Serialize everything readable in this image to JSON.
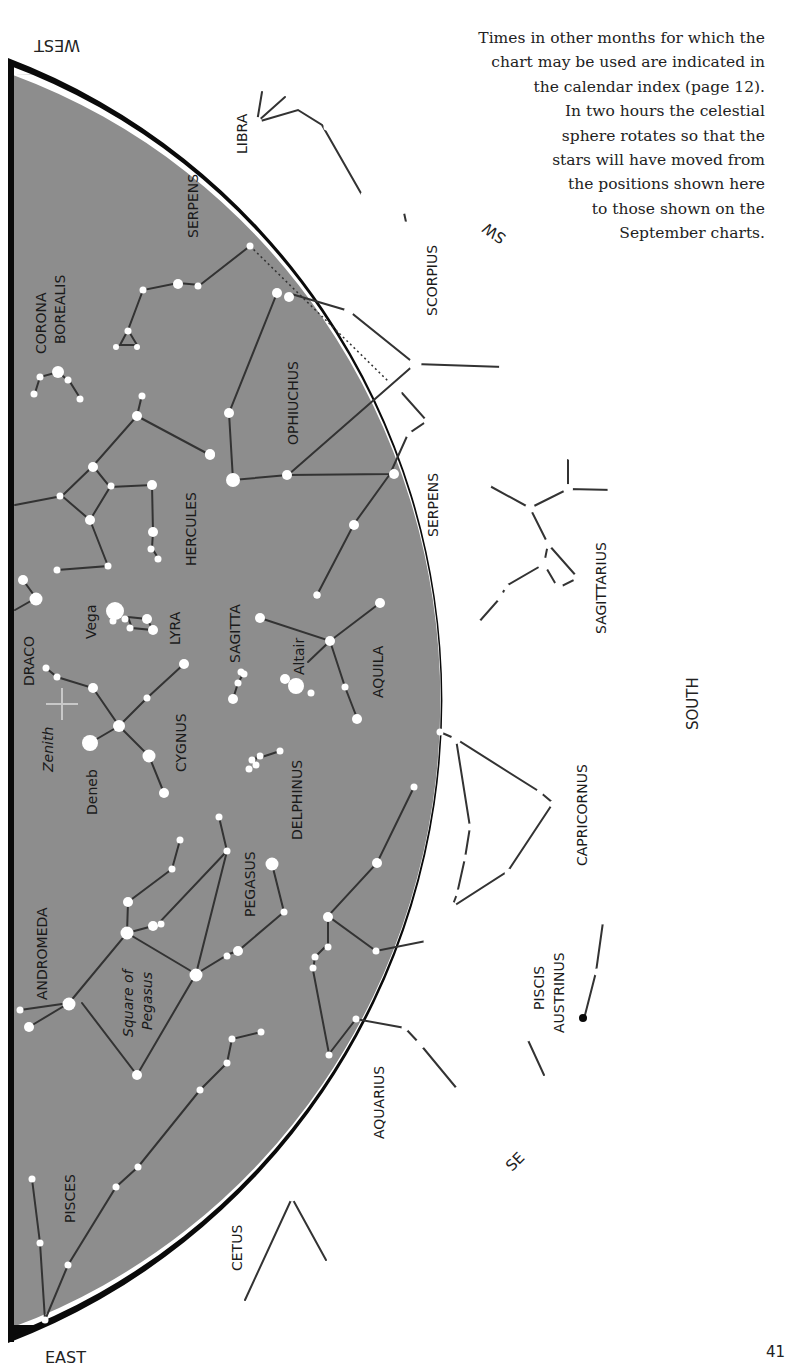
{
  "caption": {
    "lines": [
      "Times in other months for which the",
      "chart may be used are indicated in",
      "the calendar index (page 12).",
      "In two hours the celestial",
      "sphere rotates so that the",
      "stars will have moved from",
      "the positions shown here",
      "to those shown on the",
      "September charts."
    ]
  },
  "page_number": "41",
  "cardinals": {
    "west": "WEST",
    "sw": "SW",
    "south": "SOUTH",
    "se": "SE",
    "east": "EAST"
  },
  "colors": {
    "sky": "#8d8d8d",
    "horizon": "#0a0a0a",
    "star": "#ffffff",
    "line": "#333333",
    "zenith": "#c8c8c8"
  },
  "constellations": [
    {
      "name": "LIBRA",
      "x": 247,
      "y": 125
    },
    {
      "name": "SERPENS",
      "x": 198,
      "y": 210
    },
    {
      "name": "CORONA",
      "x": 44,
      "y": 293
    },
    {
      "name": "BOREALIS",
      "x": 63,
      "y": 300
    },
    {
      "name": "SCORPIUS",
      "x": 432,
      "y": 260
    },
    {
      "name": "OPHIUCHUS",
      "x": 297,
      "y": 375
    },
    {
      "name": "HERCULES",
      "x": 196,
      "y": 505
    },
    {
      "name": "SERPENS",
      "x": 438,
      "y": 492
    },
    {
      "name": "SAGITTARIUS",
      "x": 606,
      "y": 557
    },
    {
      "name": "DRACO",
      "x": 33,
      "y": 650
    },
    {
      "name": "LYRA",
      "x": 178,
      "y": 623
    },
    {
      "name": "SAGITTA",
      "x": 240,
      "y": 627
    },
    {
      "name": "AQUILA",
      "x": 383,
      "y": 660
    },
    {
      "name": "CYGNUS",
      "x": 186,
      "y": 720
    },
    {
      "name": "DELPHINUS",
      "x": 300,
      "y": 785
    },
    {
      "name": "CAPRICORNUS",
      "x": 585,
      "y": 790
    },
    {
      "name": "PEGASUS",
      "x": 254,
      "y": 875
    },
    {
      "name": "ANDROMEDA",
      "x": 46,
      "y": 932
    },
    {
      "name": "PISCIS",
      "x": 545,
      "y": 990
    },
    {
      "name": "AUSTRINUS",
      "x": 565,
      "y": 985
    },
    {
      "name": "AQUARIUS",
      "x": 384,
      "y": 1100
    },
    {
      "name": "PISCES",
      "x": 75,
      "y": 1190
    },
    {
      "name": "CETUS",
      "x": 242,
      "y": 1238
    }
  ],
  "star_labels": [
    {
      "name": "Vega",
      "x": 95,
      "y": 610,
      "italic": false
    },
    {
      "name": "Altair",
      "x": 302,
      "y": 655,
      "italic": false
    },
    {
      "name": "Deneb",
      "x": 96,
      "y": 782,
      "italic": false
    },
    {
      "name": "Zenith",
      "x": 48,
      "y": 765,
      "italic": true
    },
    {
      "name": "Square of",
      "x": 132,
      "y": 1010,
      "italic": true
    },
    {
      "name": "Pegasus",
      "x": 152,
      "y": 1010,
      "italic": true
    }
  ]
}
